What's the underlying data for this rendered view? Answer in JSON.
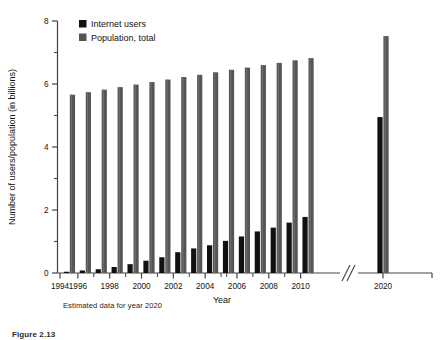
{
  "figure": {
    "number_label": "Figure  2.13",
    "note": "Estimated data for year 2020"
  },
  "colors": {
    "internet_users": "#111111",
    "population": "#555555",
    "axis": "#444444",
    "background": "#ffffff"
  },
  "chart_data": {
    "type": "bar",
    "title": "",
    "xlabel": "Year",
    "ylabel": "Number of users/population (in billions)",
    "ylim": [
      0,
      8
    ],
    "ytick_labels": [
      "0",
      "2",
      "4",
      "6",
      "8"
    ],
    "ytick_values": [
      0,
      2,
      4,
      6,
      8
    ],
    "yminor_values": [
      1,
      3,
      5,
      7
    ],
    "grid": false,
    "legend_position": "top-left-inside",
    "axis_break": true,
    "axis_break_between": [
      2010,
      2020
    ],
    "xtick_labels": [
      "1994",
      "1996",
      "1998",
      "2000",
      "2002",
      "2004",
      "2006",
      "2008",
      "2010",
      "2020"
    ],
    "xtick_values": [
      1994,
      1996,
      1998,
      2000,
      2002,
      2004,
      2006,
      2008,
      2010,
      2020
    ],
    "categories": [
      1995,
      1996,
      1997,
      1998,
      1999,
      2000,
      2001,
      2002,
      2003,
      2004,
      2005,
      2006,
      2007,
      2008,
      2009,
      2010,
      2020
    ],
    "series": [
      {
        "name": "Internet users",
        "color": "#111111",
        "values": [
          0.04,
          0.08,
          0.12,
          0.19,
          0.28,
          0.39,
          0.5,
          0.66,
          0.78,
          0.88,
          1.02,
          1.16,
          1.32,
          1.44,
          1.6,
          1.78,
          4.95
        ]
      },
      {
        "name": "Population, total",
        "color": "#555555",
        "values": [
          5.66,
          5.74,
          5.82,
          5.9,
          5.98,
          6.06,
          6.14,
          6.22,
          6.29,
          6.37,
          6.45,
          6.52,
          6.6,
          6.67,
          6.75,
          6.82,
          7.52
        ]
      }
    ],
    "legend": [
      {
        "label": "Internet users",
        "swatch": "#111111"
      },
      {
        "label": "Population, total",
        "swatch": "#555555"
      }
    ]
  }
}
